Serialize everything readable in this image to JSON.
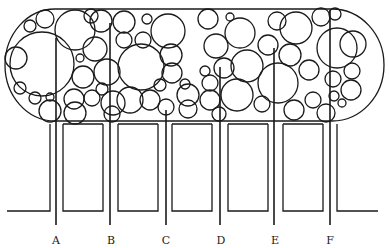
{
  "diagram": {
    "stroke_color": "#1a1a1a",
    "background": "#ffffff",
    "labels": [
      {
        "id": "A",
        "text": "A",
        "x": 56,
        "line_top": 38
      },
      {
        "id": "B",
        "text": "B",
        "x": 110,
        "line_top": 23
      },
      {
        "id": "C",
        "text": "C",
        "x": 166,
        "line_top": 110
      },
      {
        "id": "D",
        "text": "D",
        "x": 220,
        "line_top": 67
      },
      {
        "id": "E",
        "text": "E",
        "x": 274,
        "line_top": 48
      },
      {
        "id": "F",
        "text": "F",
        "x": 330,
        "line_top": 10
      }
    ]
  }
}
